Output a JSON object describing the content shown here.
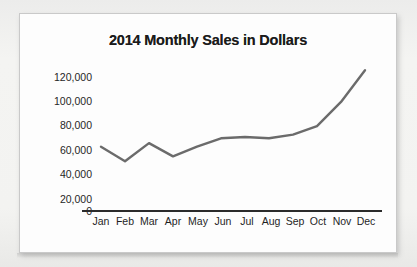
{
  "chart_data": {
    "type": "line",
    "title": "2014 Monthly Sales in Dollars",
    "xlabel": "",
    "ylabel": "",
    "categories": [
      "Jan",
      "Feb",
      "Mar",
      "Apr",
      "May",
      "Jun",
      "Jul",
      "Aug",
      "Sep",
      "Oct",
      "Nov",
      "Dec"
    ],
    "values": [
      53000,
      41000,
      56000,
      45000,
      53000,
      60000,
      61000,
      60000,
      63000,
      70000,
      90000,
      116000
    ],
    "series": [
      {
        "name": "Monthly Sales",
        "values": [
          53000,
          41000,
          56000,
          45000,
          53000,
          60000,
          61000,
          60000,
          63000,
          70000,
          90000,
          116000
        ]
      }
    ],
    "ylim": [
      0,
      120000
    ],
    "y_ticks": [
      0,
      20000,
      40000,
      60000,
      80000,
      100000,
      120000
    ],
    "y_tick_labels": [
      "0",
      "20,000",
      "40,000",
      "60,000",
      "80,000",
      "100,000",
      "120,000"
    ],
    "grid": false,
    "legend": false,
    "legend_position": "none",
    "line_color": "#6b6b6b",
    "axis_color": "#2b2b2b",
    "title_color": "#1b1b1b"
  },
  "figure": {
    "background_color": "#fdfdfd",
    "page_background_color": "#f2f2f0",
    "border_color": "#c9c9c9"
  }
}
